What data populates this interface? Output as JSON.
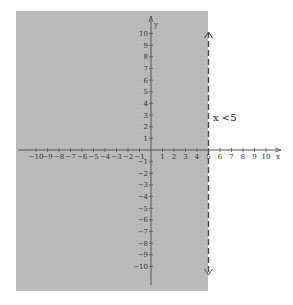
{
  "chart_data": {
    "type": "inequality-graph",
    "title": "",
    "inequality": "x <5",
    "boundary_x": 5,
    "boundary_style": "dashed",
    "shaded_side": "left",
    "xlabel": "x",
    "ylabel": "y",
    "xlim": [
      -10,
      10
    ],
    "ylim": [
      -10,
      10
    ],
    "x_ticks": [
      -10,
      -9,
      -8,
      -7,
      -6,
      -5,
      -4,
      -3,
      -2,
      -1,
      1,
      2,
      3,
      4,
      5,
      6,
      7,
      8,
      9,
      10
    ],
    "y_ticks": [
      -10,
      -9,
      -8,
      -7,
      -6,
      -5,
      -4,
      -3,
      -2,
      -1,
      1,
      2,
      3,
      4,
      5,
      6,
      7,
      8,
      9,
      10
    ],
    "grid": false
  },
  "colors": {
    "shade": "#b9b9b9",
    "axis": "#555555",
    "boundary": "#444444"
  },
  "labels": {
    "x_axis": "x",
    "y_axis": "y",
    "inequality": "x <5"
  }
}
